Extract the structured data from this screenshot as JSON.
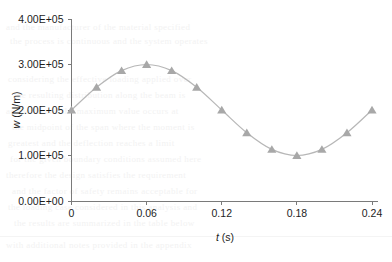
{
  "chart_data": {
    "type": "line",
    "title": "",
    "subtitle": "",
    "xlabel": "t (s)",
    "xlabel_variable": "t",
    "xlabel_unit": "(s)",
    "ylabel": "w (N/m)",
    "ylabel_variable": "w",
    "ylabel_unit": "(N/m)",
    "xlim": [
      0,
      0.24
    ],
    "ylim": [
      0,
      400000
    ],
    "grid": false,
    "legend": "none",
    "marker": "triangle",
    "line_color": "#b7b7b7",
    "marker_color": "#a8a8a8",
    "axis_color": "#7a7a7a",
    "background_color": "#ffffff",
    "xticks": [
      0,
      0.06,
      0.12,
      0.18,
      0.24
    ],
    "xtick_labels": [
      "0",
      "0.06",
      "0.12",
      "0.18",
      "0.24"
    ],
    "yticks": [
      0,
      100000,
      200000,
      300000,
      400000
    ],
    "ytick_labels": [
      "0.00E+00",
      "1.00E+05",
      "2.00E+05",
      "3.00E+05",
      "4.00E+05"
    ],
    "x": [
      0,
      0.02,
      0.04,
      0.06,
      0.08,
      0.1,
      0.12,
      0.14,
      0.16,
      0.18,
      0.2,
      0.22,
      0.24
    ],
    "values": [
      200000,
      250000,
      286600,
      300000,
      286600,
      250000,
      200000,
      150000,
      113400,
      100000,
      113400,
      150000,
      200000
    ],
    "series": [
      {
        "name": "w(t)",
        "values": [
          200000,
          250000,
          286600,
          300000,
          286600,
          250000,
          200000,
          150000,
          113400,
          100000,
          113400,
          150000,
          200000
        ]
      }
    ]
  },
  "background_bleed": {
    "lines": [
      {
        "text": "and the manufacturer of the material specified",
        "x": 6,
        "y": 28
      },
      {
        "text": "the process is continuous and the system operates",
        "x": 10,
        "y": 42
      },
      {
        "text": "considering the effective loading applied over",
        "x": 8,
        "y": 80
      },
      {
        "text": "the resulting distribution along the beam is",
        "x": 14,
        "y": 96
      },
      {
        "text": "as shown and the maximum value occurs at",
        "x": 6,
        "y": 112
      },
      {
        "text": "the midpoint of the span where the moment is",
        "x": 12,
        "y": 128
      },
      {
        "text": "greatest and the deflection reaches a limit",
        "x": 8,
        "y": 144
      },
      {
        "text": "for the given boundary conditions assumed here",
        "x": 10,
        "y": 160
      },
      {
        "text": "therefore the design satisfies the requirement",
        "x": 6,
        "y": 176
      },
      {
        "text": "and the factor of safety remains acceptable for",
        "x": 12,
        "y": 192
      },
      {
        "text": "the loading case considered in this analysis and",
        "x": 8,
        "y": 208
      },
      {
        "text": "the results are summarized in the table below",
        "x": 14,
        "y": 224
      },
      {
        "text": "with additional notes provided in the appendix",
        "x": 6,
        "y": 246
      }
    ]
  }
}
